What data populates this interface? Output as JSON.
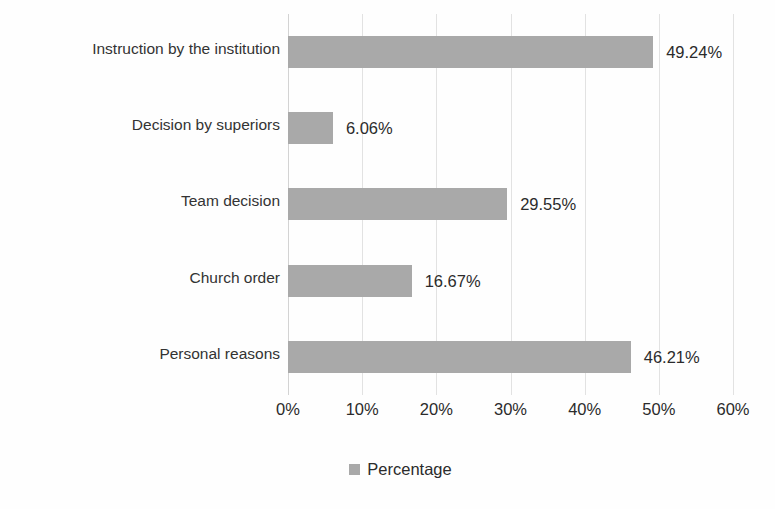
{
  "chart_data": {
    "type": "bar",
    "orientation": "horizontal",
    "title": "",
    "xlabel": "",
    "ylabel": "",
    "categories": [
      "Instruction by the institution",
      "Decision by superiors",
      "Team decision",
      "Church order",
      "Personal reasons"
    ],
    "values": [
      49.24,
      6.06,
      29.55,
      16.67,
      46.21
    ],
    "value_labels": [
      "49.24%",
      "6.06%",
      "29.55%",
      "16.67%",
      "46.21%"
    ],
    "xlim": [
      0,
      60
    ],
    "xtick_values": [
      0,
      10,
      20,
      30,
      40,
      50,
      60
    ],
    "xtick_labels": [
      "0%",
      "10%",
      "20%",
      "30%",
      "40%",
      "50%",
      "60%"
    ],
    "grid": true,
    "grid_axis": "x",
    "legend": {
      "position": "bottom",
      "entries": [
        {
          "name": "Percentage",
          "color": "#a9a9a9"
        }
      ]
    },
    "series": [
      {
        "name": "Percentage",
        "color": "#a9a9a9",
        "values": [
          49.24,
          6.06,
          29.55,
          16.67,
          46.21
        ]
      }
    ]
  },
  "colors": {
    "bar": "#a9a9a9",
    "gridline": "#e2e2e2",
    "axis": "#d3d3d3",
    "text": "#2b2b2b",
    "background": "#fefefe"
  }
}
